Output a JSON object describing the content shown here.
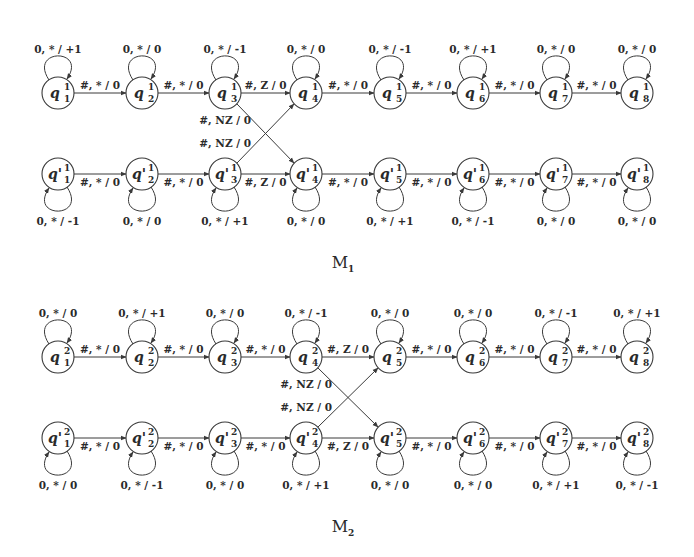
{
  "diagrams": [
    {
      "name": "M1",
      "title": "M",
      "title_sub": "1",
      "top_row": {
        "state_prefix": "q",
        "superscript": "1",
        "states": [
          "1",
          "2",
          "3",
          "4",
          "5",
          "6",
          "7",
          "8"
        ],
        "self_loops": [
          "0, * / +1",
          "0, * / 0",
          "0, * / -1",
          "0, * / 0",
          "0, * / -1",
          "0, * / +1",
          "0, * / 0",
          "0, * / 0"
        ],
        "transitions": [
          "#, * / 0",
          "#, * / 0",
          "#, Z / 0",
          "#, * / 0",
          "#, * / 0",
          "#, * / 0",
          "#, * / 0"
        ]
      },
      "bottom_row": {
        "state_prefix": "q'",
        "superscript": "1",
        "states": [
          "1",
          "2",
          "3",
          "4",
          "5",
          "6",
          "7",
          "8"
        ],
        "self_loops": [
          "0, * / -1",
          "0, * / 0",
          "0, * / +1",
          "0, * / 0",
          "0, * / +1",
          "0, * / -1",
          "0, * / 0",
          "0, * / 0"
        ],
        "transitions": [
          "#, * / 0",
          "#, * / 0",
          "#, Z / 0",
          "#, * / 0",
          "#, * / 0",
          "#, * / 0",
          "#, * / 0"
        ]
      },
      "cross_labels": [
        "#, NZ / 0",
        "#, NZ / 0"
      ],
      "cross_from_index": 2
    },
    {
      "name": "M2",
      "title": "M",
      "title_sub": "2",
      "top_row": {
        "state_prefix": "q",
        "superscript": "2",
        "states": [
          "1",
          "2",
          "3",
          "4",
          "5",
          "6",
          "7",
          "8"
        ],
        "self_loops": [
          "0, * / 0",
          "0, * / +1",
          "0, * / 0",
          "0, * / -1",
          "0, * / 0",
          "0, * / 0",
          "0, * / -1",
          "0, * / +1"
        ],
        "transitions": [
          "#, * / 0",
          "#, * / 0",
          "#, * / 0",
          "#, Z / 0",
          "#, * / 0",
          "#, * / 0",
          "#, * / 0"
        ]
      },
      "bottom_row": {
        "state_prefix": "q'",
        "superscript": "2",
        "states": [
          "1",
          "2",
          "3",
          "4",
          "5",
          "6",
          "7",
          "8"
        ],
        "self_loops": [
          "0, * / 0",
          "0, * / -1",
          "0, * / 0",
          "0, * / +1",
          "0, * / 0",
          "0, * / 0",
          "0, * / +1",
          "0, * / -1"
        ],
        "transitions": [
          "#, * / 0",
          "#, * / 0",
          "#, * / 0",
          "#, Z / 0",
          "#, * / 0",
          "#, * / 0",
          "#, * / 0"
        ]
      },
      "cross_labels": [
        "#, NZ / 0",
        "#, NZ / 0"
      ],
      "cross_from_index": 3
    }
  ],
  "colors": {
    "stroke": "#3a3a3a",
    "text": "#2a2a2a",
    "background": "#ffffff"
  }
}
